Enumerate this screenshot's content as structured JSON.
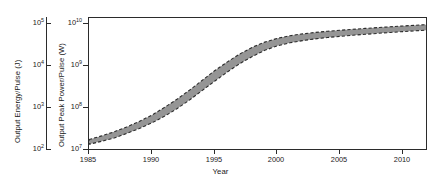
{
  "figure": {
    "background": "#ffffff",
    "frame_color": "#2b2b2b"
  },
  "annotation": {
    "line1": "100 Hz pulse rate",
    "line2": "3 to 12  GHz frequency range"
  },
  "axes": {
    "energy": {
      "title": "Output Energy/Pulse (J)",
      "ticks": [
        {
          "label_mantissa": "10",
          "label_exponent": "5",
          "value": 100000.0
        },
        {
          "label_mantissa": "10",
          "label_exponent": "4",
          "value": 10000.0
        },
        {
          "label_mantissa": "10",
          "label_exponent": "3",
          "value": 1000.0
        },
        {
          "label_mantissa": "10",
          "label_exponent": "2",
          "value": 100.0
        }
      ]
    },
    "power": {
      "title": "Output Peak Power/Pulse (W)",
      "ticks": [
        {
          "label_mantissa": "10",
          "label_exponent": "10",
          "value": 10000000000.0
        },
        {
          "label_mantissa": "10",
          "label_exponent": "9",
          "value": 1000000000.0
        },
        {
          "label_mantissa": "10",
          "label_exponent": "8",
          "value": 100000000.0
        },
        {
          "label_mantissa": "10",
          "label_exponent": "7",
          "value": 10000000.0
        }
      ]
    },
    "year": {
      "title": "Year",
      "ticks": [
        "1985",
        "1990",
        "1995",
        "2000",
        "2005",
        "2010"
      ]
    }
  },
  "chart_data": {
    "type": "area",
    "title": "",
    "xlabel": "Year",
    "ylabel": "Output Peak Power/Pulse (W)",
    "ylabel_secondary": "Output Energy/Pulse (J)",
    "xlim": [
      1985,
      2012
    ],
    "ylim": [
      10000000.0,
      32000000000.0
    ],
    "ylim_secondary": [
      100.0,
      320000.0
    ],
    "yscale": "log",
    "grid": false,
    "legend": null,
    "band_fill": "#8c8c8c",
    "band_edge_style": "dashed",
    "band_edge_color": "#2b2b2b",
    "annotations": [
      "100 Hz pulse rate",
      "3 to 12  GHz frequency range"
    ],
    "x": [
      1985,
      1986,
      1987,
      1988,
      1989,
      1990,
      1991,
      1992,
      1993,
      1994,
      1995,
      1996,
      1997,
      1998,
      1999,
      2000,
      2001,
      2002,
      2003,
      2004,
      2005,
      2006,
      2007,
      2008,
      2009,
      2010,
      2011,
      2012
    ],
    "series": [
      {
        "name": "upper bound",
        "values": [
          20000000.0,
          25000000.0,
          32000000.0,
          43000000.0,
          60000000.0,
          88000000.0,
          140000000.0,
          230000000.0,
          400000000.0,
          720000000.0,
          1300000000.0,
          2200000000.0,
          3600000000.0,
          5400000000.0,
          7400000000.0,
          9300000000.0,
          10900000000.0,
          12200000000.0,
          13300000000.0,
          14300000000.0,
          15200000000.0,
          16100000000.0,
          17000000000.0,
          17900000000.0,
          18800000000.0,
          19700000000.0,
          20600000000.0,
          21500000000.0
        ]
      },
      {
        "name": "lower bound",
        "values": [
          15000000.0,
          18000000.0,
          22000000.0,
          29000000.0,
          39000000.0,
          55000000.0,
          82000000.0,
          130000000.0,
          220000000.0,
          390000000.0,
          690000000.0,
          1200000000.0,
          2000000000.0,
          3100000000.0,
          4500000000.0,
          5900000000.0,
          7100000000.0,
          8100000000.0,
          9000000000.0,
          9800000000.0,
          10500000000.0,
          11200000000.0,
          11900000000.0,
          12600000000.0,
          13300000000.0,
          14000000000.0,
          14700000000.0,
          15400000000.0
        ]
      }
    ]
  }
}
